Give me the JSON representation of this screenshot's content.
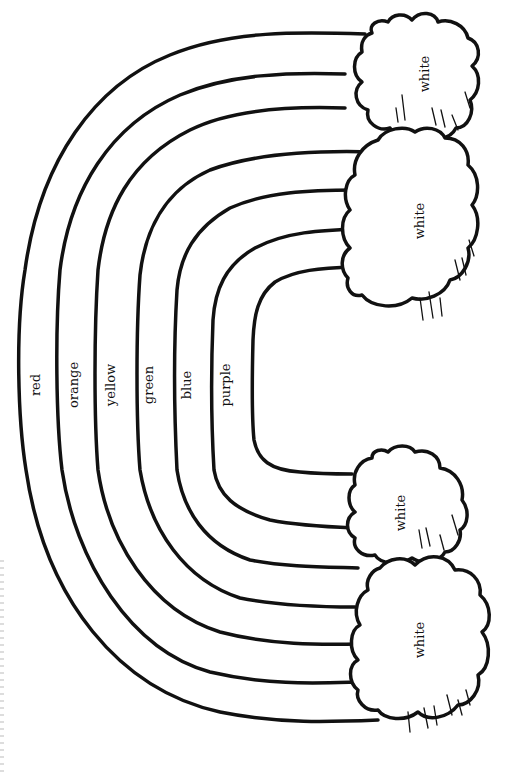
{
  "page": {
    "orientation": "rotated 90 degrees"
  },
  "bands": [
    {
      "label": "red",
      "color": "#e53935"
    },
    {
      "label": "orange",
      "color": "#fb8c00"
    },
    {
      "label": "yellow",
      "color": "#fdd835"
    },
    {
      "label": "green",
      "color": "#43a047"
    },
    {
      "label": "blue",
      "color": "#1e88e5"
    },
    {
      "label": "purple",
      "color": "#8e24aa"
    }
  ],
  "clouds": [
    {
      "label": "white",
      "position": "top-outer"
    },
    {
      "label": "white",
      "position": "top-inner"
    },
    {
      "label": "white",
      "position": "bottom-inner"
    },
    {
      "label": "white",
      "position": "bottom-outer"
    }
  ],
  "colors": {
    "outline": "#111111",
    "background": "#ffffff"
  }
}
